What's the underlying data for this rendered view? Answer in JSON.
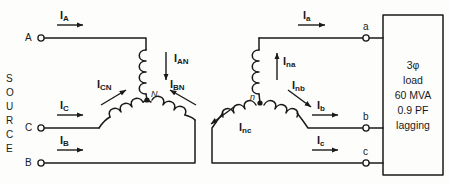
{
  "diagram": {
    "source_label_letters": [
      "S",
      "O",
      "U",
      "R",
      "C",
      "E"
    ],
    "line_color": "#1a1a1a",
    "background": "#fdfdfc"
  },
  "source": {
    "terminals": [
      {
        "name": "A",
        "label": "A"
      },
      {
        "name": "C",
        "label": "C"
      },
      {
        "name": "B",
        "label": "B"
      }
    ],
    "neutral_label": "N",
    "line_currents": [
      {
        "name": "I_A",
        "base": "I",
        "sub": "A"
      },
      {
        "name": "I_C",
        "base": "I",
        "sub": "C"
      },
      {
        "name": "I_B",
        "base": "I",
        "sub": "B"
      }
    ],
    "phase_currents": [
      {
        "name": "I_AN",
        "base": "I",
        "sub": "AN"
      },
      {
        "name": "I_BN",
        "base": "I",
        "sub": "BN"
      },
      {
        "name": "I_CN",
        "base": "I",
        "sub": "CN"
      }
    ]
  },
  "secondary": {
    "neutral_label": "n",
    "terminals": [
      {
        "name": "a",
        "label": "a"
      },
      {
        "name": "b",
        "label": "b"
      },
      {
        "name": "c",
        "label": "c"
      }
    ],
    "line_currents": [
      {
        "name": "I_a",
        "base": "I",
        "sub": "a"
      },
      {
        "name": "I_b",
        "base": "I",
        "sub": "b"
      },
      {
        "name": "I_c",
        "base": "I",
        "sub": "c"
      }
    ],
    "phase_currents": [
      {
        "name": "I_na",
        "base": "I",
        "sub": "na"
      },
      {
        "name": "I_nb",
        "base": "I",
        "sub": "nb"
      },
      {
        "name": "I_nc",
        "base": "I",
        "sub": "nc"
      }
    ]
  },
  "load": {
    "lines": [
      "3φ",
      "load",
      "60 MVA",
      "0.9 PF",
      "lagging"
    ],
    "line_1": "3φ",
    "line_2": "load",
    "line_3": "60 MVA",
    "line_4": "0.9 PF",
    "line_5": "lagging"
  }
}
